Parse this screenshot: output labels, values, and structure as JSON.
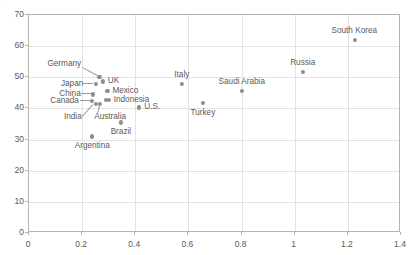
{
  "top_fragment": {
    "text": "↑   ▪                ▪▪"
  },
  "chart_data": {
    "type": "scatter",
    "title": "",
    "xlabel": "",
    "ylabel": "",
    "xlim": [
      0,
      1.4
    ],
    "ylim": [
      0,
      70
    ],
    "xticks": [
      "0",
      "0.2",
      "0.4",
      "0.6",
      "0.8",
      "1",
      "1.2",
      "1.4"
    ],
    "xtick_values": [
      0,
      0.2,
      0.4,
      0.6,
      0.8,
      1.0,
      1.2,
      1.4
    ],
    "yticks": [
      "0",
      "10",
      "20",
      "30",
      "40",
      "50",
      "60",
      "70"
    ],
    "ytick_values": [
      0,
      10,
      20,
      30,
      40,
      50,
      60,
      70
    ],
    "grid": true,
    "legend": "none",
    "marker_color": "#8c8c8c",
    "grid_color": "#e2e2e2",
    "axis_color": "#b4b4b4",
    "points": [
      {
        "label": "South Korea",
        "x": 1.225,
        "y": 62.0,
        "label_pos": "above",
        "leader": false
      },
      {
        "label": "Russia",
        "x": 1.03,
        "y": 51.6,
        "label_pos": "above",
        "leader": false
      },
      {
        "label": "Italy",
        "x": 0.575,
        "y": 47.8,
        "label_pos": "above",
        "leader": false
      },
      {
        "label": "Saudi Arabia",
        "x": 0.8,
        "y": 45.6,
        "label_pos": "above",
        "leader": false
      },
      {
        "label": "Turkey",
        "x": 0.655,
        "y": 41.7,
        "label_pos": "below",
        "leader": false
      },
      {
        "label": "U.S.",
        "x": 0.415,
        "y": 40.3,
        "label_pos": "right",
        "leader": false
      },
      {
        "label": "Germany",
        "x": 0.265,
        "y": 50.0,
        "label_pos": "leader-upleft",
        "leader": true
      },
      {
        "label": "UK",
        "x": 0.278,
        "y": 48.7,
        "label_pos": "right",
        "leader": false
      },
      {
        "label": "Japan",
        "x": 0.252,
        "y": 47.8,
        "label_pos": "leader-left",
        "leader": true
      },
      {
        "label": "Mexico",
        "x": 0.295,
        "y": 45.5,
        "label_pos": "right",
        "leader": false
      },
      {
        "label": "China",
        "x": 0.242,
        "y": 44.5,
        "label_pos": "leader-left",
        "leader": true
      },
      {
        "label": "Indonesia",
        "x": 0.3,
        "y": 42.7,
        "label_pos": "right",
        "leader": false
      },
      {
        "label": "Indonesia2",
        "x": 0.288,
        "y": 42.7,
        "label_pos": "none",
        "leader": false
      },
      {
        "label": "Canada",
        "x": 0.238,
        "y": 42.3,
        "label_pos": "leader-left",
        "leader": true
      },
      {
        "label": "India",
        "x": 0.252,
        "y": 41.5,
        "label_pos": "leader-downleft",
        "leader": true
      },
      {
        "label": "Australia",
        "x": 0.268,
        "y": 41.5,
        "label_pos": "leader-down",
        "leader": true
      },
      {
        "label": "Brazil",
        "x": 0.345,
        "y": 35.5,
        "label_pos": "below",
        "leader": false
      },
      {
        "label": "Argentina",
        "x": 0.238,
        "y": 31.0,
        "label_pos": "below",
        "leader": false
      }
    ]
  }
}
